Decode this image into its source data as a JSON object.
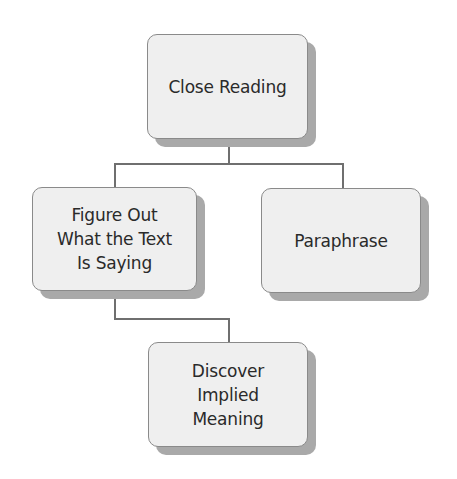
{
  "diagram": {
    "type": "hierarchy",
    "nodes": [
      {
        "id": "root",
        "label": "Close Reading"
      },
      {
        "id": "left",
        "label": "Figure Out\nWhat the Text\nIs Saying"
      },
      {
        "id": "right",
        "label": "Paraphrase"
      },
      {
        "id": "bottom",
        "label": "Discover\nImplied\nMeaning"
      }
    ],
    "edges": [
      {
        "from": "Close Reading",
        "to": "Figure Out What the Text Is Saying"
      },
      {
        "from": "Close Reading",
        "to": "Paraphrase"
      },
      {
        "from": "Figure Out What the Text Is Saying",
        "to": "Discover Implied Meaning"
      }
    ],
    "colors": {
      "node_fill": "#efefef",
      "node_border": "#8a8a8a",
      "shadow": "#a9a9a9",
      "connector": "#6f6f6f",
      "text": "#2a2a2a"
    }
  }
}
